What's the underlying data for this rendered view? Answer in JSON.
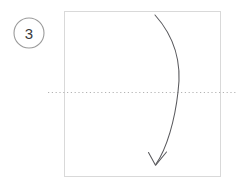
{
  "figure": {
    "kind": "paper-folding-step-diagram",
    "canvas": {
      "width": 242,
      "height": 184,
      "background": "#ffffff"
    },
    "step": {
      "badge_label": "3",
      "badge_shape": "circle",
      "badge_center_x": 29,
      "badge_center_y": 33,
      "badge_radius": 15,
      "badge_stroke_color": "#9a9a9a",
      "badge_stroke_width": 1.1,
      "badge_fill": "#ffffff",
      "badge_text_color": "#3b3b3b"
    },
    "panel": {
      "name": "paper-sheet",
      "x": 64,
      "y": 11,
      "width": 157,
      "height": 166,
      "stroke_color": "#d9d9d9",
      "stroke_width": 1,
      "fill": "#ffffff"
    },
    "fold_line": {
      "name": "horizontal-fold-crease",
      "orientation": "horizontal",
      "y": 92.5,
      "x_start": 48,
      "x_end": 238,
      "style": "dotted",
      "color": "#b3b3b3",
      "stroke_width": 1.2,
      "dash_pattern": "1.2 2.6"
    },
    "fold_arrow": {
      "name": "fold-direction-arrow",
      "start_x": 155,
      "start_y": 15,
      "end_x": 156,
      "end_y": 164,
      "bulge_x": 178,
      "bulge_y": 92,
      "direction": "top-to-bottom",
      "color": "#59595d",
      "stroke_width": 1.05,
      "arrowhead": "open-v",
      "arrowhead_tip_x": 155,
      "arrowhead_tip_y": 165
    }
  }
}
